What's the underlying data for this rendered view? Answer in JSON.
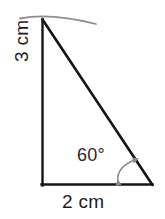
{
  "figure": {
    "type": "geometry-diagram",
    "background_color": "#ffffff",
    "stroke_color": "#151515",
    "arc_color": "#8a8a8a",
    "arrow_color": "#8a8a8a",
    "labels": {
      "vertical_side": "3 cm",
      "base_side": "2 cm",
      "angle": "60°"
    },
    "shape": {
      "vertices": {
        "apex": {
          "x": 42,
          "y": 20
        },
        "bottom_left": {
          "x": 42,
          "y": 185
        },
        "bottom_right": {
          "x": 152,
          "y": 185
        }
      },
      "vertical_length_cm": 3,
      "base_length_cm": 2,
      "marked_angle_degrees": 60,
      "right_angle_vertex": "bottom_left"
    },
    "top_arc": {
      "description": "shallow curved line through apex",
      "start": {
        "x": 20,
        "y": 18
      },
      "end": {
        "x": 96,
        "y": 24
      },
      "peak": {
        "x": 48,
        "y": 14
      }
    },
    "angle_arrow": {
      "description": "double-headed curved arrow marking the angle",
      "start": {
        "x": 117,
        "y": 183
      },
      "end": {
        "x": 137,
        "y": 159
      }
    }
  }
}
